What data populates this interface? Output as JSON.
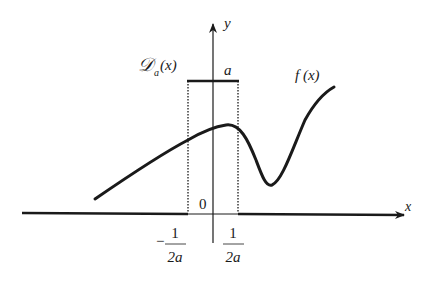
{
  "figure": {
    "axes": {
      "x_label": "x",
      "y_label": "y",
      "origin_label": "0"
    },
    "pulse": {
      "label_main": "𝒟",
      "label_sub": "a",
      "label_arg": "(x)",
      "height_label": "a",
      "left_tick": {
        "sign": "−",
        "numerator": "1",
        "denominator": "2a"
      },
      "right_tick": {
        "numerator": "1",
        "denominator": "2a"
      }
    },
    "curve": {
      "label": "f (x)"
    },
    "colors": {
      "ink": "#1a1a1a",
      "background": "#ffffff"
    }
  }
}
